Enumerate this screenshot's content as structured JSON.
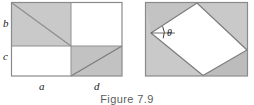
{
  "figure": {
    "caption": "Figure 7.9",
    "colors": {
      "shade_fill": "#c9c9c9",
      "shade_fill_dark": "#bdbdbd",
      "white_fill": "#ffffff",
      "stroke": "#8a8a8a",
      "stroke_dark": "#6e6e6e",
      "label_color": "#1a1a1a",
      "caption_color": "#5c5c5c",
      "page_background": "#ffffff"
    },
    "left_diagram": {
      "name": "subdivided-rectangle",
      "outer_rect": {
        "x": 11,
        "y": 2,
        "width": 111,
        "height": 74
      },
      "split_x": 71,
      "split_y": 46,
      "shaded_quadrants": [
        "top-left",
        "bottom-right"
      ],
      "diagonals": [
        {
          "name": "upper-left-diagonal",
          "from": "top-left",
          "to": "split-point"
        },
        {
          "name": "lower-right-diagonal",
          "from": "bottom-left",
          "to": "top-right"
        }
      ],
      "labels": {
        "left_upper": "b",
        "left_lower": "c",
        "bottom_left": "a",
        "bottom_right": "d"
      }
    },
    "right_diagram": {
      "name": "inscribed-quadrilateral",
      "outer_rect": {
        "x": 145,
        "y": 2,
        "width": 103,
        "height": 74
      },
      "inner_vertices": [
        {
          "name": "left-vertex",
          "x": 151,
          "y": 33
        },
        {
          "name": "top-vertex",
          "x": 197,
          "y": 3
        },
        {
          "name": "right-vertex",
          "x": 247,
          "y": 50
        },
        {
          "name": "bottom-vertex",
          "x": 203,
          "y": 75
        }
      ],
      "angle_label": "θ",
      "angle_vertex": "left-vertex"
    }
  }
}
